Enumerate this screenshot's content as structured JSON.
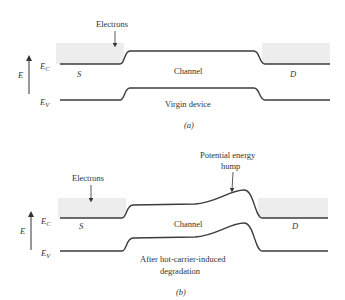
{
  "panel_a": {
    "electrons_label": "Electrons",
    "axis_label": "E",
    "ec_label_main": "E",
    "ec_label_sub": "C",
    "ev_label_main": "E",
    "ev_label_sub": "V",
    "source_label": "S",
    "drain_label": "D",
    "channel_label": "Channel",
    "device_label": "Virgin device",
    "caption": "(a)"
  },
  "panel_b": {
    "electrons_label": "Electrons",
    "hump_label_line1": "Potential energy",
    "hump_label_line2": "hump",
    "axis_label": "E",
    "ec_label_main": "E",
    "ec_label_sub": "C",
    "ev_label_main": "E",
    "ev_label_sub": "V",
    "source_label": "S",
    "drain_label": "D",
    "channel_label": "Channel",
    "device_label_line1": "After hot-carrier-induced",
    "device_label_line2": "degradation",
    "caption": "(b)"
  },
  "colors": {
    "line": "#3c3c3c",
    "shade": "#ededed",
    "text": "#333333"
  }
}
